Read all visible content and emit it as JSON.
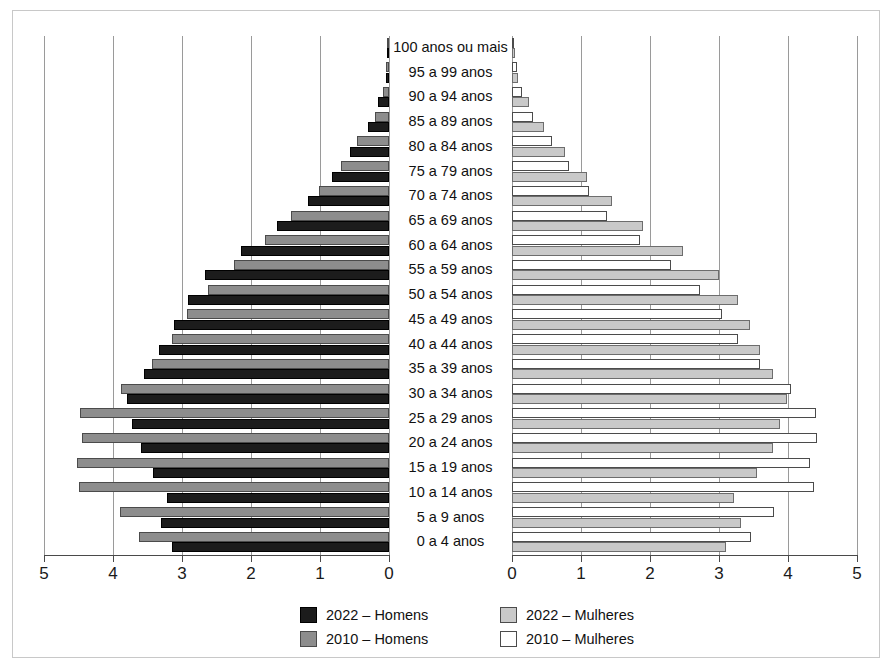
{
  "chart_data": {
    "type": "bar",
    "title": "",
    "subtitle": "",
    "xlabel": "",
    "ylabel": "",
    "orientation": "horizontal",
    "layout": "population-pyramid",
    "grid": true,
    "legend_position": "bottom",
    "axis": {
      "left_ticks": [
        "5",
        "4",
        "3",
        "2",
        "1",
        "0"
      ],
      "left_tick_values": [
        5,
        4,
        3,
        2,
        1,
        0
      ],
      "right_ticks": [
        "0",
        "1",
        "2",
        "3",
        "4",
        "5"
      ],
      "right_tick_values": [
        0,
        1,
        2,
        3,
        4,
        5
      ],
      "xlim": [
        0,
        5
      ],
      "left_reversed": true
    },
    "categories": [
      "100 anos ou mais",
      "95 a 99 anos",
      "90 a 94 anos",
      "85 a 89 anos",
      "80 a 84 anos",
      "75 a 79 anos",
      "70 a 74 anos",
      "65 a 69 anos",
      "60 a 64 anos",
      "55 a 59 anos",
      "50 a 54 anos",
      "45 a 49 anos",
      "40 a 44 anos",
      "35 a 39 anos",
      "30 a 34 anos",
      "25 a 29 anos",
      "20 a 24 anos",
      "15 a 19 anos",
      "10 a 14 anos",
      "5 a 9 anos",
      "0 a 4 anos"
    ],
    "series": [
      {
        "name": "2022 – Homens",
        "side": "left",
        "color": "#1c1c1c",
        "values": [
          0.02,
          0.05,
          0.16,
          0.31,
          0.56,
          0.83,
          1.18,
          1.62,
          2.15,
          2.67,
          2.92,
          3.12,
          3.33,
          3.55,
          3.8,
          3.72,
          3.6,
          3.42,
          3.22,
          3.3,
          3.14
        ]
      },
      {
        "name": "2010 – Homens",
        "side": "left",
        "color": "#8d8d8d",
        "values": [
          0.01,
          0.04,
          0.09,
          0.21,
          0.46,
          0.7,
          1.02,
          1.42,
          1.8,
          2.25,
          2.62,
          2.93,
          3.15,
          3.44,
          3.88,
          4.48,
          4.45,
          4.52,
          4.5,
          3.9,
          3.62
        ]
      },
      {
        "name": "2022 – Mulheres",
        "side": "right",
        "color": "#c9c9c9",
        "values": [
          0.04,
          0.09,
          0.24,
          0.46,
          0.77,
          1.08,
          1.45,
          1.9,
          2.48,
          3.0,
          3.27,
          3.45,
          3.6,
          3.78,
          3.98,
          3.88,
          3.78,
          3.55,
          3.22,
          3.32,
          3.1
        ]
      },
      {
        "name": "2010 – Mulheres",
        "side": "right",
        "color": "#ffffff",
        "values": [
          0.02,
          0.07,
          0.14,
          0.3,
          0.58,
          0.82,
          1.12,
          1.38,
          1.85,
          2.3,
          2.72,
          3.05,
          3.28,
          3.6,
          4.05,
          4.4,
          4.42,
          4.32,
          4.38,
          3.8,
          3.47
        ]
      }
    ]
  },
  "legend": {
    "items": [
      {
        "label": "2022 – Homens",
        "swatch": "solid-dark",
        "color": "#1c1c1c"
      },
      {
        "label": "2022 – Mulheres",
        "swatch": "solid-light",
        "color": "#c9c9c9"
      },
      {
        "label": "2010 – Homens",
        "swatch": "solid-gray",
        "color": "#8d8d8d"
      },
      {
        "label": "2010 – Mulheres",
        "swatch": "outline",
        "color": "#ffffff"
      }
    ]
  }
}
